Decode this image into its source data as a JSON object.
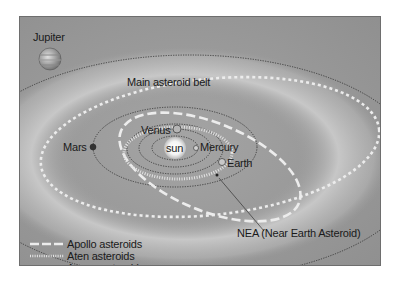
{
  "diagram": {
    "labels": {
      "jupiter": "Jupiter",
      "main_belt": "Main asteroid belt",
      "venus": "Venus",
      "sun": "sun",
      "mercury": "Mercury",
      "mars": "Mars",
      "earth": "Earth",
      "nea": "NEA (Near Earth Asteroid)"
    },
    "legend": [
      {
        "label": "Apollo asteroids",
        "style": "long-dash"
      },
      {
        "label": "Aten asteroids",
        "style": "dotted"
      },
      {
        "label": "Amore asteroids",
        "style": "short-dash"
      }
    ],
    "colors": {
      "background": "#9c9c9c",
      "belt": "#c4c4c4",
      "orbit_line": "#333333",
      "asteroid_orbit": "#e8e8e8",
      "text": "#1a1a1a"
    }
  }
}
